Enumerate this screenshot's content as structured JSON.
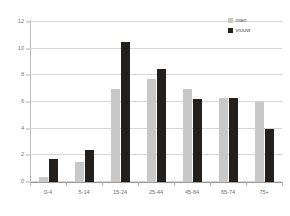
{
  "chart_data": {
    "type": "bar",
    "title": "",
    "subtitle": "",
    "xlabel": "",
    "ylabel": "",
    "ylim": [
      0,
      12
    ],
    "yticks": [
      0,
      2,
      4,
      6,
      8,
      10,
      12
    ],
    "ytick_labels": [
      "0",
      "2",
      "4",
      "6",
      "8",
      "10",
      "12"
    ],
    "grid": true,
    "legend_position": "top-right",
    "categories": [
      "0-4",
      "5-14",
      "15-24",
      "25-44",
      "45-64",
      "65-74",
      "75+"
    ],
    "series": [
      {
        "name": "man",
        "color": "#c8c8c8",
        "values": [
          0.4,
          1.5,
          7.0,
          7.7,
          7.0,
          6.3,
          6.0
        ]
      },
      {
        "name": "vrouw",
        "color": "#231f1c",
        "values": [
          1.7,
          2.4,
          10.5,
          8.5,
          6.2,
          6.3,
          4.0
        ]
      }
    ]
  },
  "legend": {
    "items": [
      {
        "label": "man",
        "swatch": "man"
      },
      {
        "label": "vrouw",
        "swatch": "vrouw"
      }
    ]
  },
  "axes": {
    "y": {
      "ticks": [
        "0",
        "2",
        "4",
        "6",
        "8",
        "10",
        "12"
      ]
    },
    "x": {
      "ticks": [
        "0-4",
        "5-14",
        "15-24",
        "25-44",
        "45-64",
        "65-74",
        "75+"
      ]
    }
  }
}
